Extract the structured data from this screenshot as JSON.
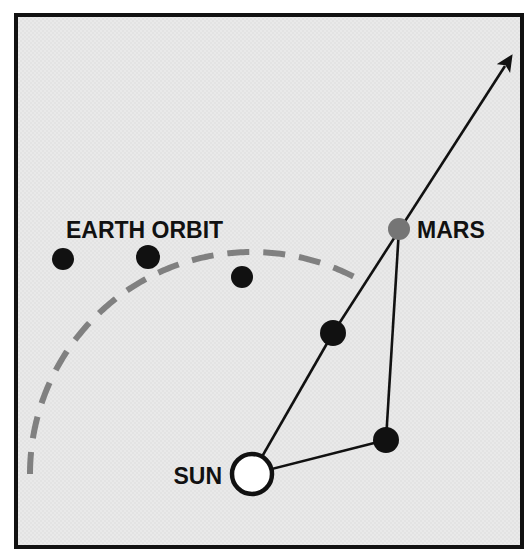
{
  "figure": {
    "type": "astronomy-orbit-diagram",
    "background_color": "#e8e8e8",
    "frame_color": "#111111",
    "canvas": {
      "width": 524,
      "height": 557
    }
  },
  "labels": {
    "earth_orbit": "EARTH ORBIT",
    "mars": "MARS",
    "sun": "SUN"
  },
  "colors": {
    "orbit_dash": "#808080",
    "earth_dot": "#111111",
    "mars_dot": "#757575",
    "sight_line": "#111111",
    "sun_stroke": "#111111",
    "sun_fill": "#ffffff"
  },
  "chart_data": {
    "type": "scatter",
    "title": "",
    "grid": false,
    "legend": null,
    "frame": {
      "x": 14,
      "y": 13,
      "width": 510,
      "height": 536,
      "stroke_width": 4
    },
    "sun": {
      "label": "SUN",
      "cx": 252,
      "cy": 474,
      "r": 20,
      "stroke_width": 4.5,
      "filled": false
    },
    "mars": {
      "label": "MARS",
      "cx": 399,
      "cy": 229,
      "r": 11,
      "filled": true,
      "color": "#757575"
    },
    "earth_orbit": {
      "label": "EARTH ORBIT",
      "style": "dashed-arc",
      "stroke_width": 6,
      "dash_pattern": "22 14",
      "center": {
        "cx": 252,
        "cy": 474
      },
      "radius": 222,
      "start_angle_deg": 180,
      "end_angle_deg": 62
    },
    "earth_positions": [
      {
        "index": 1,
        "cx": 63,
        "cy": 259,
        "r": 11
      },
      {
        "index": 2,
        "cx": 148,
        "cy": 257,
        "r": 12
      },
      {
        "index": 3,
        "cx": 242,
        "cy": 277,
        "r": 11
      },
      {
        "index": 4,
        "cx": 333,
        "cy": 333,
        "r": 13
      },
      {
        "index": 5,
        "cx": 386,
        "cy": 440,
        "r": 13
      }
    ],
    "sight_lines": [
      {
        "name": "sun-to-earth4",
        "from": [
          252,
          474
        ],
        "to": [
          333,
          333
        ]
      },
      {
        "name": "sun-to-earth5",
        "from": [
          252,
          474
        ],
        "to": [
          386,
          440
        ]
      },
      {
        "name": "earth4-to-mars-extended",
        "from": [
          333,
          333
        ],
        "to": [
          505,
          66
        ]
      },
      {
        "name": "earth5-to-mars",
        "from": [
          386,
          440
        ],
        "to": [
          399,
          229
        ]
      }
    ],
    "arrow": {
      "name": "line-of-sight-arrow",
      "tip": [
        505,
        66
      ],
      "angle_deg": 57,
      "size": 30
    },
    "label_positions": {
      "earth_orbit": {
        "x": 66,
        "y": 238,
        "font_size": 23,
        "anchor": "start"
      },
      "mars": {
        "x": 417,
        "y": 238,
        "font_size": 23,
        "anchor": "start"
      },
      "sun": {
        "x": 222,
        "y": 484,
        "font_size": 23,
        "anchor": "end"
      }
    }
  }
}
